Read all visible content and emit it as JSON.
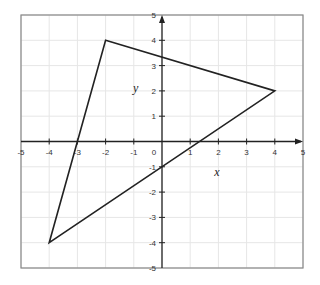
{
  "chart_data": {
    "type": "line",
    "title": "",
    "xlabel": "x",
    "ylabel": "y",
    "xlim": [
      -5,
      5
    ],
    "ylim": [
      -5,
      5
    ],
    "grid": true,
    "x_ticks": [
      -5,
      -4,
      -3,
      -2,
      -1,
      0,
      1,
      2,
      3,
      4,
      5
    ],
    "y_ticks": [
      -5,
      -4,
      -3,
      -2,
      -1,
      1,
      2,
      3,
      4,
      5
    ],
    "x_tick_labels": [
      "-5",
      "-4",
      "-3",
      "-2",
      "-1",
      "0",
      "1",
      "2",
      "3",
      "4",
      "5"
    ],
    "y_tick_labels": [
      "-5",
      "-4",
      "-3",
      "-2",
      "-1",
      "1",
      "2",
      "3",
      "4",
      "5"
    ],
    "series": [
      {
        "name": "triangle",
        "closed": true,
        "points": [
          {
            "x": -2,
            "y": 4
          },
          {
            "x": 4,
            "y": 2
          },
          {
            "x": -4,
            "y": -4
          }
        ]
      }
    ],
    "colors": {
      "grid": "#e6e6e6",
      "frame": "#888888",
      "axis": "#222222",
      "line": "#222222"
    }
  }
}
